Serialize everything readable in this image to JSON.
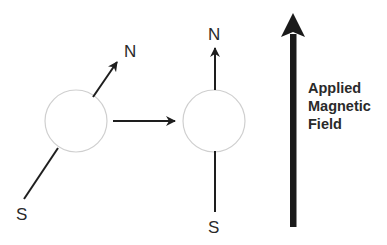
{
  "diagram": {
    "colors": {
      "line": "#1e1e1e",
      "circle_stroke": "#cfcfcf",
      "text": "#2a2a2a",
      "background": "#ffffff"
    },
    "before": {
      "north_label": "N",
      "south_label": "S",
      "orientation": "tilted"
    },
    "transition_arrow": "right-arrow",
    "after": {
      "north_label": "N",
      "south_label": "S",
      "orientation": "aligned-vertical"
    },
    "field": {
      "label_line1": "Applied",
      "label_line2": "Magnetic",
      "label_line3": "Field",
      "direction": "up"
    }
  }
}
